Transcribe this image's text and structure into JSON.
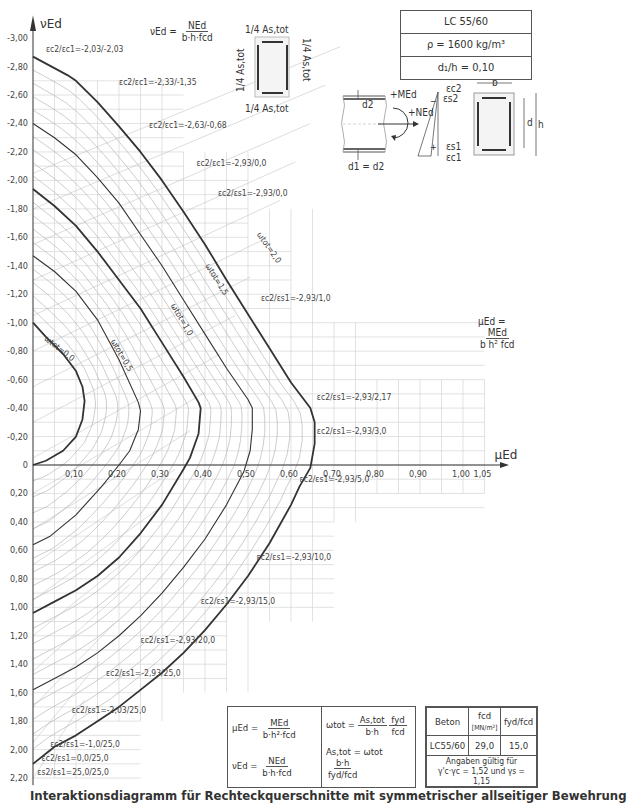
{
  "chart_data": {
    "type": "line",
    "title": "Interaktionsdiagramm für Rechteckquerschnitte mit symmetrischer allseitiger Bewehrung",
    "xlabel": "μEd",
    "ylabel": "νEd",
    "xlim": [
      0,
      1.05
    ],
    "ylim": [
      -3.0,
      2.2
    ],
    "y_inverted": true,
    "grid": true,
    "x_ticks": [
      "0",
      "0,10",
      "0,20",
      "0,30",
      "0,40",
      "0,50",
      "0,60",
      "0,70",
      "0,80",
      "0,90",
      "1,00",
      "1,05"
    ],
    "x_tick_values": [
      0,
      0.1,
      0.2,
      0.3,
      0.4,
      0.5,
      0.6,
      0.7,
      0.8,
      0.9,
      1.0,
      1.05
    ],
    "y_ticks": [
      "-3,00",
      "-2,80",
      "-2,60",
      "-2,40",
      "-2,20",
      "-2,00",
      "-1,80",
      "-1,60",
      "-1,40",
      "-1,20",
      "-1,00",
      "-0,80",
      "-0,60",
      "-0,40",
      "-0,20",
      "0",
      "0,20",
      "0,40",
      "0,60",
      "0,80",
      "1,00",
      "1,20",
      "1,40",
      "1,60",
      "1,80",
      "2,00",
      "2,20"
    ],
    "y_tick_values": [
      -3.0,
      -2.8,
      -2.6,
      -2.4,
      -2.2,
      -2.0,
      -1.8,
      -1.6,
      -1.4,
      -1.2,
      -1.0,
      -0.8,
      -0.6,
      -0.4,
      -0.2,
      0,
      0.2,
      0.4,
      0.6,
      0.8,
      1.0,
      1.2,
      1.4,
      1.6,
      1.8,
      2.0,
      2.2
    ],
    "series": [
      {
        "name": "ω_tot = 0,0",
        "bold": true,
        "points": [
          [
            0,
            -1.0
          ],
          [
            0.03,
            -0.9
          ],
          [
            0.07,
            -0.78
          ],
          [
            0.1,
            -0.66
          ],
          [
            0.115,
            -0.55
          ],
          [
            0.12,
            -0.45
          ],
          [
            0.115,
            -0.32
          ],
          [
            0.1,
            -0.2
          ],
          [
            0.07,
            -0.1
          ],
          [
            0.03,
            -0.03
          ],
          [
            0,
            0
          ]
        ]
      },
      {
        "name": "ω_tot = 0,5",
        "bold": false,
        "points": [
          [
            0,
            -1.47
          ],
          [
            0.05,
            -1.36
          ],
          [
            0.1,
            -1.22
          ],
          [
            0.15,
            -1.02
          ],
          [
            0.2,
            -0.74
          ],
          [
            0.245,
            -0.44
          ],
          [
            0.25,
            -0.38
          ],
          [
            0.245,
            -0.25
          ],
          [
            0.225,
            -0.1
          ],
          [
            0.2,
            0
          ],
          [
            0.16,
            0.15
          ],
          [
            0.1,
            0.35
          ],
          [
            0.04,
            0.5
          ],
          [
            0,
            0.56
          ]
        ]
      },
      {
        "name": "ω_tot = 1,0",
        "bold": true,
        "points": [
          [
            0,
            -1.94
          ],
          [
            0.05,
            -1.82
          ],
          [
            0.1,
            -1.68
          ],
          [
            0.15,
            -1.5
          ],
          [
            0.2,
            -1.3
          ],
          [
            0.25,
            -1.1
          ],
          [
            0.3,
            -0.86
          ],
          [
            0.35,
            -0.62
          ],
          [
            0.385,
            -0.44
          ],
          [
            0.39,
            -0.4
          ],
          [
            0.385,
            -0.22
          ],
          [
            0.365,
            -0.05
          ],
          [
            0.35,
            0.03
          ],
          [
            0.3,
            0.28
          ],
          [
            0.25,
            0.48
          ],
          [
            0.2,
            0.65
          ],
          [
            0.15,
            0.78
          ],
          [
            0.1,
            0.88
          ],
          [
            0.05,
            0.96
          ],
          [
            0,
            1.04
          ]
        ]
      },
      {
        "name": "ω_tot = 1,5",
        "bold": false,
        "points": [
          [
            0,
            -2.4
          ],
          [
            0.05,
            -2.3
          ],
          [
            0.1,
            -2.18
          ],
          [
            0.15,
            -2.02
          ],
          [
            0.2,
            -1.84
          ],
          [
            0.25,
            -1.62
          ],
          [
            0.3,
            -1.4
          ],
          [
            0.35,
            -1.16
          ],
          [
            0.4,
            -0.92
          ],
          [
            0.45,
            -0.68
          ],
          [
            0.5,
            -0.46
          ],
          [
            0.51,
            -0.4
          ],
          [
            0.51,
            -0.25
          ],
          [
            0.505,
            -0.1
          ],
          [
            0.49,
            0.05
          ],
          [
            0.45,
            0.28
          ],
          [
            0.4,
            0.52
          ],
          [
            0.35,
            0.72
          ],
          [
            0.3,
            0.9
          ],
          [
            0.25,
            1.06
          ],
          [
            0.2,
            1.2
          ],
          [
            0.15,
            1.32
          ],
          [
            0.1,
            1.42
          ],
          [
            0.05,
            1.5
          ],
          [
            0,
            1.58
          ]
        ]
      },
      {
        "name": "ω_tot = 2,0",
        "bold": true,
        "points": [
          [
            0,
            -2.87
          ],
          [
            0.08,
            -2.74
          ],
          [
            0.1,
            -2.7
          ],
          [
            0.15,
            -2.55
          ],
          [
            0.2,
            -2.38
          ],
          [
            0.25,
            -2.2
          ],
          [
            0.3,
            -2.0
          ],
          [
            0.35,
            -1.78
          ],
          [
            0.4,
            -1.55
          ],
          [
            0.45,
            -1.3
          ],
          [
            0.5,
            -1.06
          ],
          [
            0.55,
            -0.82
          ],
          [
            0.6,
            -0.58
          ],
          [
            0.645,
            -0.4
          ],
          [
            0.655,
            -0.3
          ],
          [
            0.655,
            -0.15
          ],
          [
            0.645,
            0.02
          ],
          [
            0.62,
            0.15
          ],
          [
            0.6,
            0.28
          ],
          [
            0.55,
            0.55
          ],
          [
            0.5,
            0.78
          ],
          [
            0.45,
            0.98
          ],
          [
            0.4,
            1.16
          ],
          [
            0.35,
            1.32
          ],
          [
            0.3,
            1.46
          ],
          [
            0.25,
            1.58
          ],
          [
            0.2,
            1.7
          ],
          [
            0.15,
            1.8
          ],
          [
            0.1,
            1.9
          ],
          [
            0.05,
            1.98
          ],
          [
            0,
            2.1
          ]
        ]
      }
    ],
    "annotations": [
      {
        "text": "εc2/εc1=-2,03/-2,03",
        "mu": 0.03,
        "nu": -2.9
      },
      {
        "text": "εc2/εc1=-2,33/-1,35",
        "mu": 0.2,
        "nu": -2.67
      },
      {
        "text": "εc2/εc1=-2,63/-0,68",
        "mu": 0.27,
        "nu": -2.37
      },
      {
        "text": "εc2/εc1=-2,93/0,0",
        "mu": 0.38,
        "nu": -2.1
      },
      {
        "text": "εc2/εs1=-2,93/0,0",
        "mu": 0.43,
        "nu": -1.89
      },
      {
        "text": "εc2/εs1=-2,93/1,0",
        "mu": 0.53,
        "nu": -1.15
      },
      {
        "text": "εc2/εs1=-2,93/2,17",
        "mu": 0.66,
        "nu": -0.46
      },
      {
        "text": "εc2/εs1=-2,93/3,0",
        "mu": 0.66,
        "nu": -0.22
      },
      {
        "text": "εc2/εs1=-2,93/5,0",
        "mu": 0.62,
        "nu": 0.12
      },
      {
        "text": "εc2/εs1=-2,93/10,0",
        "mu": 0.52,
        "nu": 0.67
      },
      {
        "text": "εc2/εs1=-2,93/15,0",
        "mu": 0.39,
        "nu": 0.98
      },
      {
        "text": "εc2/εs1=-2,93/20,0",
        "mu": 0.25,
        "nu": 1.25
      },
      {
        "text": "εc2/εs1=-2,93/25,0",
        "mu": 0.17,
        "nu": 1.48
      },
      {
        "text": "εc2/εs1=-2,03/25,0",
        "mu": 0.09,
        "nu": 1.74
      },
      {
        "text": "εc2/εs1=-1,0/25,0",
        "mu": 0.04,
        "nu": 1.98
      },
      {
        "text": "εc2/εs1=0,0/25,0",
        "mu": 0.02,
        "nu": 2.08
      },
      {
        "text": "εs2/εs1=25,0/25,0",
        "mu": 0.01,
        "nu": 2.18
      }
    ],
    "omega_labels": [
      {
        "text": "ωtot=0,0",
        "mu": 0.025,
        "nu": -0.88,
        "angle": 38
      },
      {
        "text": "ωtot=0,5",
        "mu": 0.18,
        "nu": -0.87,
        "angle": 60
      },
      {
        "text": "ωtot=1,0",
        "mu": 0.32,
        "nu": -1.12,
        "angle": 60
      },
      {
        "text": "ωtot=1,5",
        "mu": 0.4,
        "nu": -1.4,
        "angle": 58
      },
      {
        "text": "ωtot=2,0",
        "mu": 0.52,
        "nu": -1.62,
        "angle": 55
      }
    ]
  },
  "spec_box": {
    "concrete": "LC 55/60",
    "density": "ρ = 1600 kg/m³",
    "ratio": "d₁/h = 0,10"
  },
  "header_formula": {
    "lhs": "νEd =",
    "num": "NEd",
    "den": "b·h·fcd"
  },
  "section_labels": {
    "quarter": "1/4 As,tot",
    "M": "+MEd",
    "N": "+NEd",
    "d2": "d2",
    "d1d2": "d1 = d2",
    "ec2": "εc2",
    "es2": "εs2",
    "es1": "εs1",
    "ec1": "εc1",
    "b": "b",
    "d": "d",
    "h": "h",
    "minus": "−",
    "plus": "+"
  },
  "mu_formula": {
    "lhs": "μEd =",
    "num": "MEd",
    "den": "b h² fcd"
  },
  "formula_box": {
    "mu_lhs": "μEd =",
    "mu_num": "MEd",
    "mu_den": "b·h²·fcd",
    "nu_lhs": "νEd =",
    "nu_num": "NEd",
    "nu_den": "b·h·fcd",
    "omega_lhs": "ωtot =",
    "omega_num1": "As,tot",
    "omega_den1": "b·h",
    "omega_num2": "fyd",
    "omega_den2": "fcd",
    "as_lhs": "As,tot = ωtot",
    "as_num": "b·h",
    "as_den": "fyd/fcd"
  },
  "concrete_table": {
    "headers": [
      "Beton",
      "fcd",
      "fyd/fcd"
    ],
    "fcd_unit": "[MN/m²]",
    "row": [
      "LC55/60",
      "29,0",
      "15,0"
    ],
    "note_line1": "Angaben gültig für",
    "note_line2": "γ'c·γc = 1,52 und γs = 1,15"
  },
  "footer": {
    "title": "Interaktionsdiagramm für Rechteckquerschnitte mit symmetrischer allseitiger Bewehrung"
  },
  "colors": {
    "line": "#333333",
    "grid": "#d6d6d6",
    "helper": "#b8b8b8",
    "text": "#333333"
  }
}
